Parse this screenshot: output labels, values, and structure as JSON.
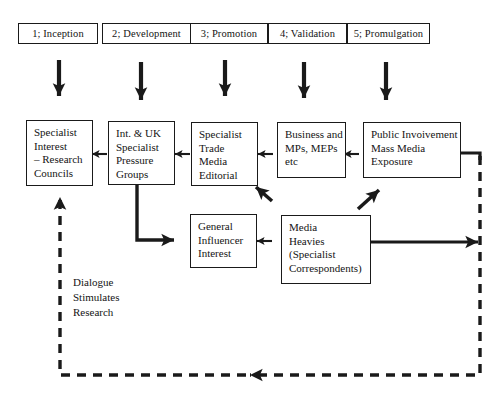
{
  "diagram": {
    "stages": [
      {
        "label": "1;  Inception"
      },
      {
        "label": "2;  Development"
      },
      {
        "label": "3;  Promotion"
      },
      {
        "label": "4;  Validation"
      },
      {
        "label": "5;  Promulgation"
      }
    ],
    "nodes": [
      {
        "id": "specialist-interest",
        "lines": [
          "Specialist",
          "Interest",
          "– Research",
          "Councils"
        ]
      },
      {
        "id": "pressure-groups",
        "lines": [
          "Int. & UK",
          "Specialist",
          "Pressure",
          "Groups"
        ]
      },
      {
        "id": "trade-media",
        "lines": [
          "Specialist",
          "Trade",
          "Media",
          "Editorial"
        ]
      },
      {
        "id": "business-mps",
        "lines": [
          "Business and",
          "MPs, MEPs",
          "etc"
        ]
      },
      {
        "id": "public-involvement",
        "lines": [
          "Public Invoivement",
          "Mass Media",
          "Exposure"
        ]
      },
      {
        "id": "general-influencer",
        "lines": [
          "General",
          "Influencer",
          "Interest"
        ]
      },
      {
        "id": "media-heavies",
        "lines": [
          "Media",
          "Heavies",
          "(Specialist",
          "Correspondents)"
        ]
      }
    ],
    "annotation": {
      "lines": [
        "Dialogue",
        "Stimulates",
        "Research"
      ]
    },
    "colors": {
      "ink": "#1a1a1a",
      "background": "#ffffff"
    }
  }
}
